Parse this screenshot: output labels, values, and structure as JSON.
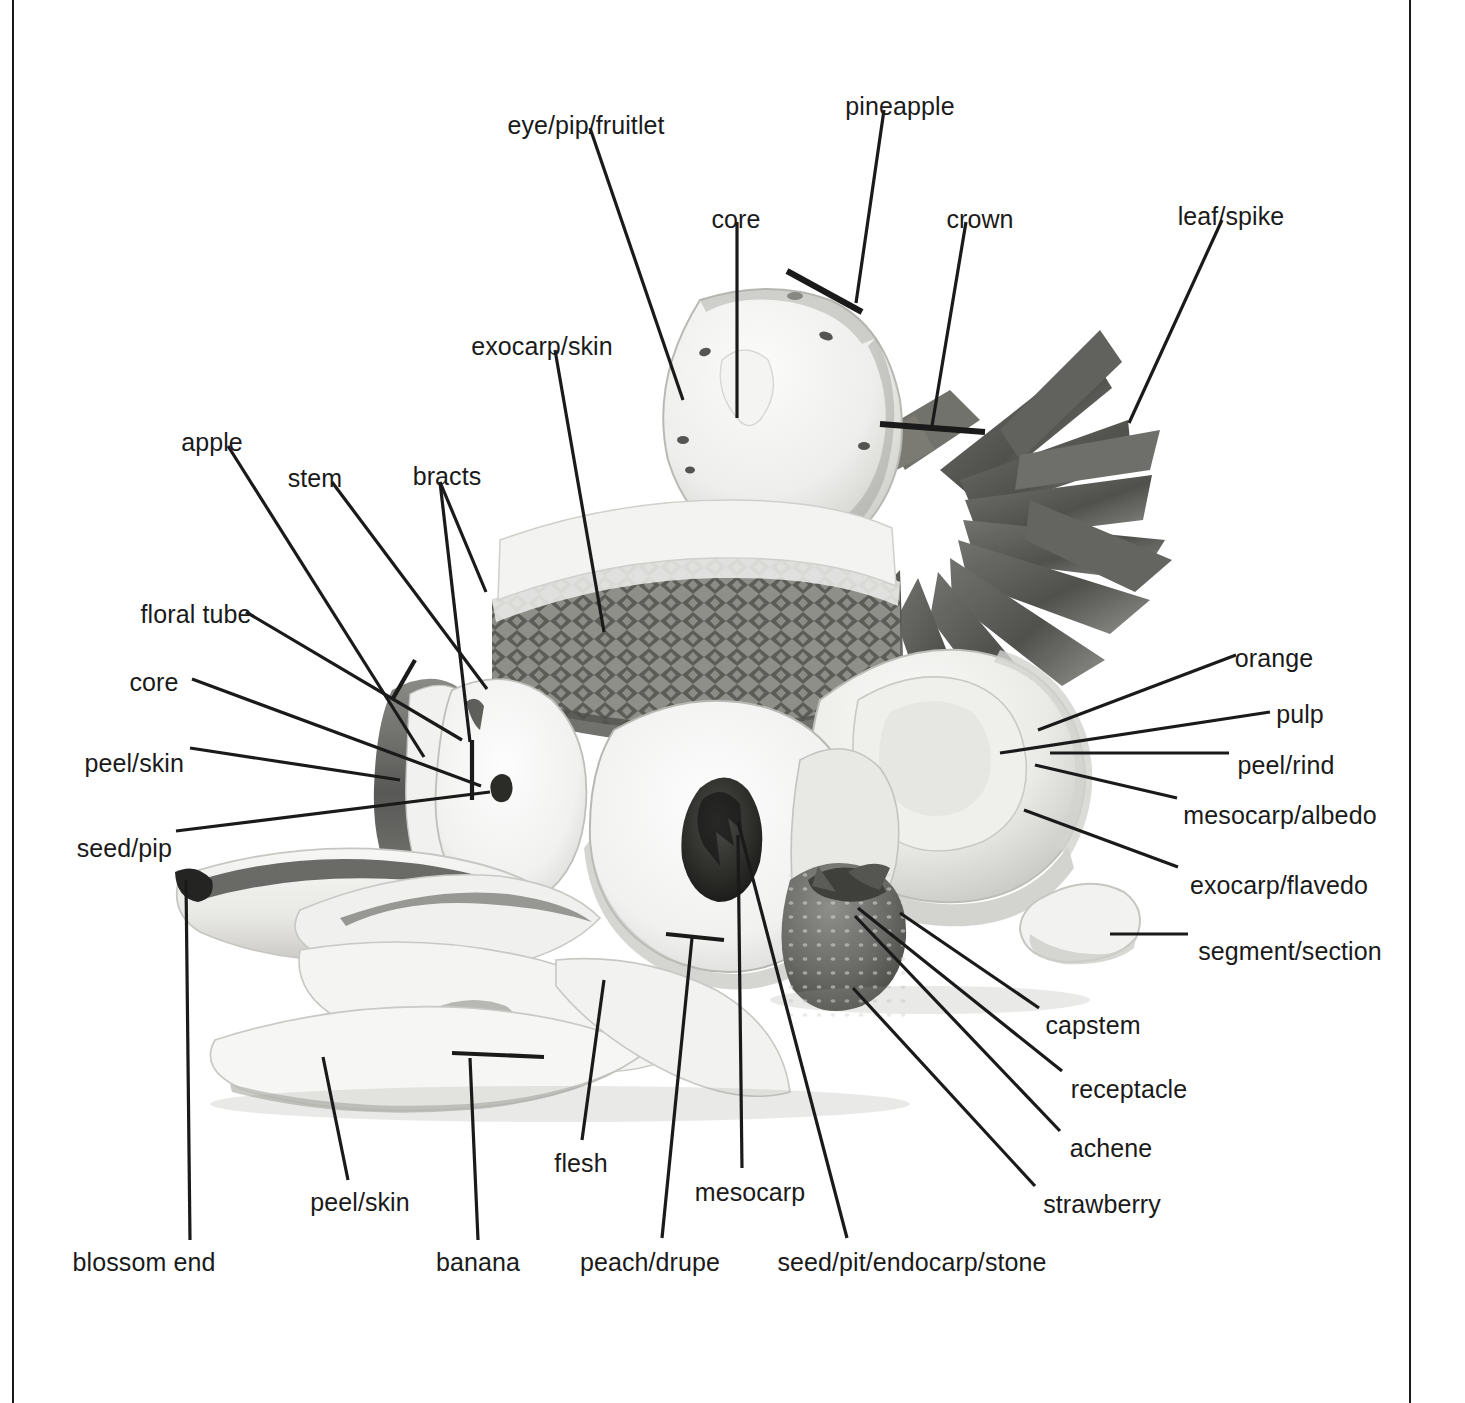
{
  "figure": {
    "style": {
      "ink_color": "#1a1a1a",
      "background_color": "#ffffff",
      "photo_tone": "grayscale"
    },
    "rules": [
      {
        "name": "left-margin-rule",
        "x": 12,
        "width": 2
      },
      {
        "name": "right-margin-rule",
        "x": 1409,
        "width": 2
      }
    ]
  },
  "labels": [
    {
      "id": "eye-pip-fruitlet",
      "text": "eye/pip/fruitlet",
      "x": 586,
      "y": 113,
      "align": "center",
      "leader": [
        [
          590,
          128
        ],
        [
          683,
          400
        ]
      ]
    },
    {
      "id": "pineapple",
      "text": "pineapple",
      "x": 900,
      "y": 94,
      "align": "center",
      "leader": [
        [
          884,
          110
        ],
        [
          856,
          303
        ]
      ],
      "tick": [
        [
          787,
          271
        ],
        [
          862,
          312
        ]
      ]
    },
    {
      "id": "core-pineapple",
      "text": "core",
      "x": 736,
      "y": 207,
      "align": "center",
      "leader": [
        [
          737,
          222
        ],
        [
          737,
          418
        ]
      ]
    },
    {
      "id": "crown",
      "text": "crown",
      "x": 980,
      "y": 207,
      "align": "center",
      "leader": [
        [
          966,
          222
        ],
        [
          932,
          426
        ]
      ],
      "tick": [
        [
          880,
          424
        ],
        [
          985,
          432
        ]
      ]
    },
    {
      "id": "leaf-spike",
      "text": "leaf/spike",
      "x": 1231,
      "y": 204,
      "align": "center",
      "leader": [
        [
          1222,
          220
        ],
        [
          1129,
          423
        ]
      ]
    },
    {
      "id": "exocarp-skin-pineapple",
      "text": "exocarp/skin",
      "x": 542,
      "y": 334,
      "align": "center",
      "leader": [
        [
          555,
          350
        ],
        [
          604,
          632
        ]
      ]
    },
    {
      "id": "apple",
      "text": "apple",
      "x": 212,
      "y": 430,
      "align": "center",
      "leader": [
        [
          228,
          446
        ],
        [
          424,
          757
        ]
      ]
    },
    {
      "id": "stem",
      "text": "stem",
      "x": 315,
      "y": 466,
      "align": "center",
      "leader": [
        [
          332,
          482
        ],
        [
          487,
          689
        ]
      ]
    },
    {
      "id": "bracts",
      "text": "bracts",
      "x": 447,
      "y": 464,
      "align": "center",
      "leader": [
        [
          440,
          482
        ],
        [
          486,
          592
        ]
      ],
      "leader2": [
        [
          440,
          482
        ],
        [
          470,
          742
        ]
      ]
    },
    {
      "id": "floral-tube",
      "text": "floral tube",
      "x": 196,
      "y": 602,
      "align": "center",
      "leader": [
        [
          246,
          612
        ],
        [
          462,
          740
        ]
      ]
    },
    {
      "id": "core-apple",
      "text": "core",
      "x": 154,
      "y": 670,
      "align": "center",
      "leader": [
        [
          192,
          679
        ],
        [
          481,
          786
        ]
      ]
    },
    {
      "id": "peel-skin-apple",
      "text": "peel/skin",
      "x": 184,
      "y": 751,
      "align": "right",
      "leader": [
        [
          190,
          748
        ],
        [
          400,
          780
        ]
      ]
    },
    {
      "id": "seed-pip",
      "text": "seed/pip",
      "x": 172,
      "y": 836,
      "align": "right",
      "leader": [
        [
          176,
          831
        ],
        [
          490,
          792
        ]
      ]
    },
    {
      "id": "orange",
      "text": "orange",
      "x": 1274,
      "y": 646,
      "align": "center",
      "leader": [
        [
          1236,
          655
        ],
        [
          1038,
          730
        ]
      ]
    },
    {
      "id": "pulp",
      "text": "pulp",
      "x": 1300,
      "y": 702,
      "align": "center",
      "leader": [
        [
          1270,
          712
        ],
        [
          1000,
          753
        ]
      ]
    },
    {
      "id": "peel-rind",
      "text": "peel/rind",
      "x": 1286,
      "y": 753,
      "align": "center",
      "leader": [
        [
          1229,
          753
        ],
        [
          1050,
          753
        ]
      ]
    },
    {
      "id": "mesocarp-albedo",
      "text": "mesocarp/albedo",
      "x": 1280,
      "y": 803,
      "align": "center",
      "leader": [
        [
          1177,
          798
        ],
        [
          1035,
          765
        ]
      ]
    },
    {
      "id": "exocarp-flavedo",
      "text": "exocarp/flavedo",
      "x": 1279,
      "y": 873,
      "align": "center",
      "leader": [
        [
          1178,
          867
        ],
        [
          1024,
          810
        ]
      ]
    },
    {
      "id": "segment-section",
      "text": "segment/section",
      "x": 1290,
      "y": 939,
      "align": "center",
      "leader": [
        [
          1188,
          934
        ],
        [
          1110,
          934
        ]
      ]
    },
    {
      "id": "capstem",
      "text": "capstem",
      "x": 1093,
      "y": 1013,
      "align": "center",
      "leader": [
        [
          1039,
          1008
        ],
        [
          900,
          913
        ]
      ]
    },
    {
      "id": "receptacle",
      "text": "receptacle",
      "x": 1129,
      "y": 1077,
      "align": "center",
      "leader": [
        [
          1062,
          1071
        ],
        [
          858,
          908
        ]
      ]
    },
    {
      "id": "achene",
      "text": "achene",
      "x": 1111,
      "y": 1136,
      "align": "center",
      "leader": [
        [
          1060,
          1131
        ],
        [
          855,
          916
        ]
      ]
    },
    {
      "id": "strawberry",
      "text": "strawberry",
      "x": 1102,
      "y": 1192,
      "align": "center",
      "leader": [
        [
          1035,
          1186
        ],
        [
          853,
          988
        ]
      ]
    },
    {
      "id": "blossom-end",
      "text": "blossom end",
      "x": 144,
      "y": 1250,
      "align": "center",
      "leader": [
        [
          190,
          1240
        ],
        [
          186,
          880
        ]
      ]
    },
    {
      "id": "peel-skin-banana",
      "text": "peel/skin",
      "x": 360,
      "y": 1190,
      "align": "center",
      "leader": [
        [
          348,
          1180
        ],
        [
          323,
          1057
        ]
      ]
    },
    {
      "id": "banana",
      "text": "banana",
      "x": 478,
      "y": 1250,
      "align": "center",
      "leader": [
        [
          478,
          1240
        ],
        [
          470,
          1058
        ]
      ],
      "tick": [
        [
          452,
          1053
        ],
        [
          544,
          1057
        ]
      ]
    },
    {
      "id": "flesh",
      "text": "flesh",
      "x": 581,
      "y": 1151,
      "align": "center",
      "leader": [
        [
          582,
          1140
        ],
        [
          604,
          980
        ]
      ]
    },
    {
      "id": "peach-drupe",
      "text": "peach/drupe",
      "x": 650,
      "y": 1250,
      "align": "center",
      "leader": [
        [
          662,
          1238
        ],
        [
          692,
          938
        ]
      ],
      "tick": [
        [
          666,
          934
        ],
        [
          724,
          940
        ]
      ]
    },
    {
      "id": "mesocarp",
      "text": "mesocarp",
      "x": 750,
      "y": 1180,
      "align": "center",
      "leader": [
        [
          742,
          1168
        ],
        [
          738,
          835
        ]
      ]
    },
    {
      "id": "seed-pit-endocarp-stone",
      "text": "seed/pit/endocarp/stone",
      "x": 912,
      "y": 1250,
      "align": "center",
      "leader": [
        [
          847,
          1238
        ],
        [
          738,
          822
        ]
      ]
    }
  ]
}
